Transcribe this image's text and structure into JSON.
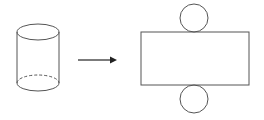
{
  "diagram": {
    "stroke_color": "#555555",
    "background": "#ffffff",
    "cylinder": {
      "cx": 38,
      "top_y": 32,
      "bottom_y": 83,
      "rx": 21,
      "ry": 8
    },
    "arrow": {
      "x1": 78,
      "x2": 116,
      "y": 60
    },
    "net": {
      "rect": {
        "x": 141,
        "y": 32,
        "width": 108,
        "height": 53
      },
      "top_circle": {
        "cx": 194,
        "cy": 18,
        "r": 14
      },
      "bottom_circle": {
        "cx": 194,
        "cy": 99,
        "r": 14
      }
    }
  }
}
